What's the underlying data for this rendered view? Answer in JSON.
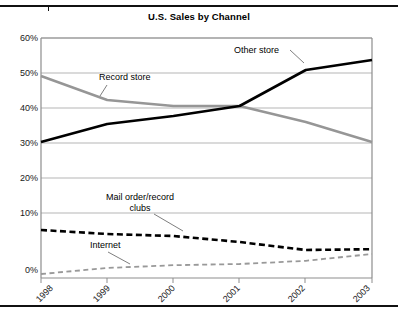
{
  "figure": {
    "title": "U.S. Sales by Channel"
  },
  "chart_data": {
    "type": "line",
    "title": "U.S. Sales by Channel",
    "xlabel": "",
    "ylabel": "",
    "categories": [
      "1998",
      "1999",
      "2000",
      "2001",
      "2002",
      "2003"
    ],
    "x": [
      1998,
      1999,
      2000,
      2001,
      2002,
      2003
    ],
    "ylim": [
      0,
      60
    ],
    "ytick_values": [
      0,
      10,
      20,
      30,
      40,
      50,
      60
    ],
    "ytick_labels": [
      "0%",
      "10%",
      "20%",
      "30%",
      "40%",
      "50%",
      "60%"
    ],
    "grid": true,
    "grid_axis": "y",
    "legend": "none",
    "annotations_inline": true,
    "units": "percent of U.S. sales",
    "series": [
      {
        "name": "Other store",
        "values": [
          34.0,
          38.5,
          40.5,
          43.0,
          52.0,
          54.5
        ],
        "color": "#000000",
        "style": "solid",
        "width": 2.6
      },
      {
        "name": "Record store",
        "values": [
          50.5,
          44.5,
          43.0,
          43.0,
          39.0,
          34.0
        ],
        "color": "#969696",
        "style": "solid",
        "width": 2.4
      },
      {
        "name": "Mail order/record clubs",
        "values": [
          12.0,
          11.0,
          10.5,
          9.0,
          7.0,
          7.2
        ],
        "color": "#000000",
        "style": "dashed",
        "width": 2.6
      },
      {
        "name": "Internet",
        "values": [
          1.0,
          2.5,
          3.2,
          3.5,
          4.3,
          6.0
        ],
        "color": "#999999",
        "style": "dashed",
        "width": 1.8
      }
    ]
  },
  "annotations": [
    {
      "label": "Record store",
      "lines": [
        "Record store"
      ]
    },
    {
      "label": "Other store",
      "lines": [
        "Other store"
      ]
    },
    {
      "label": "Mail order/record clubs",
      "lines": [
        "Mail order/record",
        "clubs"
      ]
    },
    {
      "label": "Internet",
      "lines": [
        "Internet"
      ]
    }
  ],
  "labels": {
    "y": [
      "60%",
      "50%",
      "40%",
      "30%",
      "20%",
      "10%",
      "0%"
    ],
    "x": [
      "1998",
      "1999",
      "2000",
      "2001",
      "2002",
      "2003"
    ],
    "record_store": "Record store",
    "other_store": "Other store",
    "mail_order_line1": "Mail order/record",
    "mail_order_line2": "clubs",
    "internet": "Internet"
  },
  "colors": {
    "other_store": "#000000",
    "record_store": "#969696",
    "mail_order": "#000000",
    "internet": "#999999",
    "gridline": "#b5b5b5",
    "axis": "#888888",
    "text": "#1a1a1a",
    "page_rule": "#111111"
  }
}
